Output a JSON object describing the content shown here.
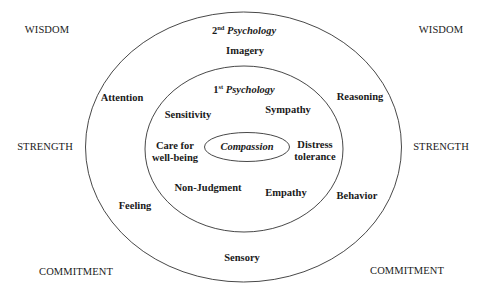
{
  "diagram": {
    "corners": {
      "top_left": "WISDOM",
      "top_right": "WISDOM",
      "middle_left": "STRENGTH",
      "middle_right": "STRENGTH",
      "bottom_left": "COMMITMENT",
      "bottom_right": "COMMITMENT"
    },
    "outer_ring": {
      "title_ordinal": "2",
      "title_suffix": "nd",
      "title_word": "Psychology",
      "items": {
        "top": "Imagery",
        "upper_left": "Attention",
        "upper_right": "Reasoning",
        "lower_left": "Feeling",
        "lower_right": "Behavior",
        "bottom": "Sensory"
      }
    },
    "inner_ring": {
      "title_ordinal": "1",
      "title_suffix": "st",
      "title_word": "Psychology",
      "items": {
        "upper_left": "Sensitivity",
        "upper_right": "Sympathy",
        "left_line1": "Care for",
        "left_line2": "well-being",
        "right_line1": "Distress",
        "right_line2": "tolerance",
        "lower_left": "Non-Judgment",
        "lower_right": "Empathy"
      }
    },
    "core": {
      "label": "Compassion"
    }
  }
}
